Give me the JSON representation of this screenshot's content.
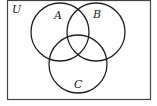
{
  "diagram": {
    "type": "venn",
    "universe": {
      "label": "U"
    },
    "sets": [
      {
        "label": "A"
      },
      {
        "label": "B"
      },
      {
        "label": "C"
      }
    ],
    "colors": {
      "stroke": "#222222",
      "background": "#ffffff"
    }
  }
}
